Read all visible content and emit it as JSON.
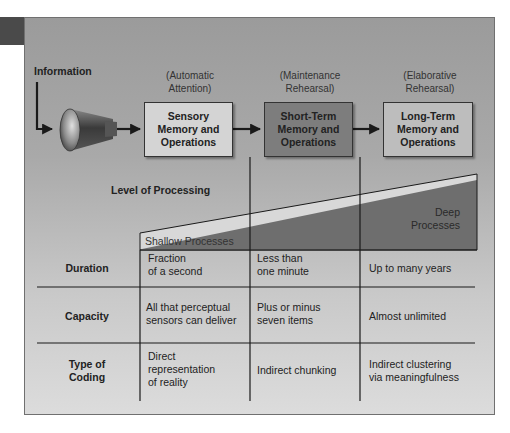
{
  "flow": {
    "input_label": "Information",
    "stages": [
      {
        "process": "(Automatic Attention)",
        "process_lines": [
          "(Automatic",
          "Attention)"
        ],
        "label_lines": [
          "Sensory",
          "Memory and",
          "Operations"
        ],
        "fill": "#d4d4d4"
      },
      {
        "process": "(Maintenance Rehearsal)",
        "process_lines": [
          "(Maintenance",
          "Rehearsal)"
        ],
        "label_lines": [
          "Short-Term",
          "Memory and",
          "Operations"
        ],
        "fill": "#7d7d7d"
      },
      {
        "process": "(Elaborative Rehearsal)",
        "process_lines": [
          "(Elaborative",
          "Rehearsal)"
        ],
        "label_lines": [
          "Long-Term",
          "Memory and",
          "Operations"
        ],
        "fill": "#bdbdbd"
      }
    ]
  },
  "processing": {
    "label": "Level of Processing",
    "shallow": "Shallow Processes",
    "deep_lines": [
      "Deep",
      "Processes"
    ]
  },
  "table": {
    "rows": [
      {
        "header_lines": [
          "Duration"
        ],
        "cells": [
          [
            "Fraction",
            "of a second"
          ],
          [
            "Less than",
            "one minute"
          ],
          [
            "Up to many years"
          ]
        ]
      },
      {
        "header_lines": [
          "Capacity"
        ],
        "cells": [
          [
            "All that perceptual",
            "sensors can deliver"
          ],
          [
            "Plus or minus",
            "seven items"
          ],
          [
            "Almost unlimited"
          ]
        ]
      },
      {
        "header_lines": [
          "Type of",
          "Coding"
        ],
        "cells": [
          [
            "Direct",
            "representation",
            "of reality"
          ],
          [
            "Indirect chunking"
          ],
          [
            "Indirect clustering",
            "via meaningfulness"
          ]
        ]
      }
    ]
  },
  "colors": {
    "tab": "#4a4a4a",
    "wedge_light": "#d8d8d8",
    "wedge_dark": "#6e6e6e",
    "line": "#1a1a1a"
  }
}
